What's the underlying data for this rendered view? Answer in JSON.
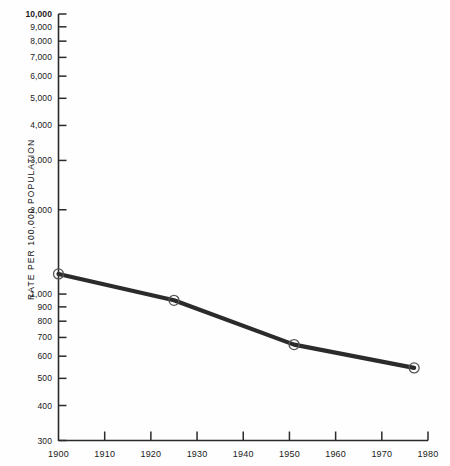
{
  "chart_data": {
    "type": "line",
    "title": "",
    "subtitle": "",
    "xlabel": "",
    "ylabel": "RATE PER 100,000 POPULATION",
    "yscale": "log",
    "ylim": [
      300,
      10000
    ],
    "xlim": [
      1900,
      1980
    ],
    "grid": false,
    "legend": false,
    "legend_position": "none",
    "x": [
      1900,
      1925,
      1951,
      1977
    ],
    "values": [
      1180,
      950,
      660,
      545
    ],
    "series": [
      {
        "name": "Rate per 100,000 population",
        "x": [
          1900,
          1925,
          1951,
          1977
        ],
        "values": [
          1180,
          950,
          660,
          545
        ],
        "marker": "open-circle",
        "color": "#2b2b2b"
      }
    ],
    "ytick_labels": [
      "10,000",
      "9,000",
      "8,000",
      "7,000",
      "6,000",
      "5,000",
      "4,000",
      "3,000",
      "2,000",
      "1,000",
      "900",
      "800",
      "700",
      "600",
      "500",
      "400",
      "300"
    ],
    "ytick_values": [
      10000,
      9000,
      8000,
      7000,
      6000,
      5000,
      4000,
      3000,
      2000,
      1000,
      900,
      800,
      700,
      600,
      500,
      400,
      300
    ],
    "xtick_labels": [
      "1900",
      "1910",
      "1920",
      "1930",
      "1940",
      "1950",
      "1960",
      "1970",
      "1980"
    ],
    "xtick_values": [
      1900,
      1910,
      1920,
      1930,
      1940,
      1950,
      1960,
      1970,
      1980
    ],
    "annotations": []
  },
  "style": {
    "axis_color": "#2a2a2a",
    "line_color": "#2b2b2b",
    "marker_edge_color": "#555555",
    "marker_fill_color": "#ffffff",
    "background_color": "#fefefe",
    "text_color": "#1a1a1a"
  }
}
